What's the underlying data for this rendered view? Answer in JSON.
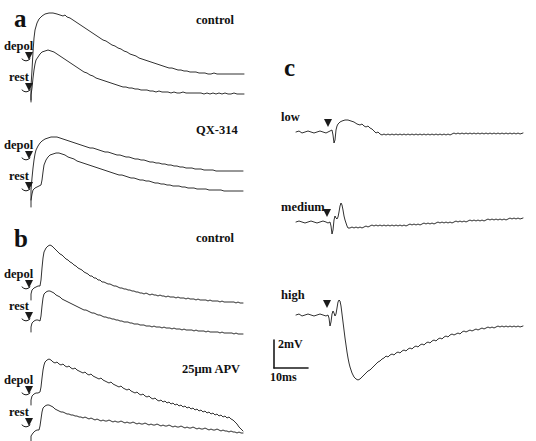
{
  "figure": {
    "background": "#ffffff",
    "ink": "#1a1a1a",
    "panels": [
      {
        "letter": "a",
        "letter_pos": [
          14,
          10
        ],
        "blocks": [
          {
            "condition": "control",
            "condition_pos": [
              196,
              14
            ],
            "traces": [
              {
                "label": "depol",
                "label_pos": [
                  4,
                  40
                ],
                "marker_pos": [
                  28,
                  57
                ]
              },
              {
                "label": "rest",
                "label_pos": [
                  8,
                  72
                ],
                "marker_pos": [
                  28,
                  88
                ]
              }
            ]
          },
          {
            "condition": "QX-314",
            "condition_pos": [
              196,
              124
            ],
            "traces": [
              {
                "label": "depol",
                "label_pos": [
                  4,
                  139
                ],
                "marker_pos": [
                  28,
                  156
                ]
              },
              {
                "label": "rest",
                "label_pos": [
                  8,
                  170
                ],
                "marker_pos": [
                  28,
                  187
                ]
              }
            ]
          }
        ]
      },
      {
        "letter": "b",
        "letter_pos": [
          14,
          230
        ],
        "blocks": [
          {
            "condition": "control",
            "condition_pos": [
              196,
              232
            ],
            "traces": [
              {
                "label": "depol",
                "label_pos": [
                  4,
                  268
                ],
                "marker_pos": [
                  28,
                  285
                ]
              },
              {
                "label": "rest",
                "label_pos": [
                  8,
                  300
                ],
                "marker_pos": [
                  28,
                  317
                ]
              }
            ]
          },
          {
            "condition": "25μm APV",
            "condition_pos": [
              184,
              363
            ],
            "traces": [
              {
                "label": "depol",
                "label_pos": [
                  4,
                  374
                ],
                "marker_pos": [
                  28,
                  391
                ]
              },
              {
                "label": "rest",
                "label_pos": [
                  8,
                  406
                ],
                "marker_pos": [
                  28,
                  423
                ]
              }
            ]
          }
        ]
      },
      {
        "letter": "c",
        "letter_pos": [
          284,
          58
        ],
        "intensity_traces": [
          {
            "label": "low",
            "label_pos": [
              281,
              110
            ],
            "marker_pos": [
              327,
              123
            ]
          },
          {
            "label": "medium",
            "label_pos": [
              281,
              200
            ],
            "marker_pos": [
              327,
              213
            ]
          },
          {
            "label": "high",
            "label_pos": [
              281,
              288
            ],
            "marker_pos": [
              327,
              303
            ]
          }
        ]
      }
    ],
    "scale_bar": {
      "voltage_label": "2mV",
      "voltage_label_pos": [
        276,
        343
      ],
      "time_label": "10ms",
      "time_label_pos": [
        270,
        379
      ],
      "corner": [
        274,
        340
      ],
      "v_length": 28,
      "h_length": 34
    }
  }
}
